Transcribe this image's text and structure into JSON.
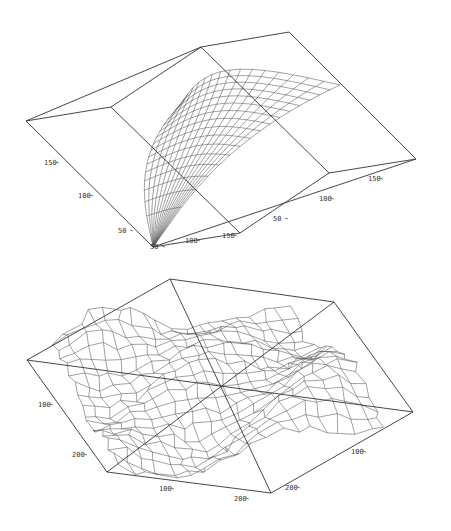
{
  "chart_data": [
    {
      "type": "surface-3d-wireframe",
      "title": "",
      "description": "Smooth saddle/dome wireframe surface inside a 3D bounding box",
      "surface_style": "smooth",
      "grid_lines": 16,
      "axes": [
        {
          "name": "left-axis",
          "ticks": [
            {
              "label": "50",
              "x": 128,
              "y": 231
            },
            {
              "label": "100",
              "x": 88,
              "y": 196
            },
            {
              "label": "150",
              "x": 54,
              "y": 163
            }
          ]
        },
        {
          "name": "front-axis",
          "ticks": [
            {
              "label": "50",
              "x": 160,
              "y": 247
            },
            {
              "label": "100",
              "x": 195,
              "y": 241
            },
            {
              "label": "150",
              "x": 232,
              "y": 236
            }
          ]
        },
        {
          "name": "right-axis",
          "ticks": [
            {
              "label": "50",
              "x": 283,
              "y": 219
            },
            {
              "label": "100",
              "x": 329,
              "y": 199
            },
            {
              "label": "150",
              "x": 378,
              "y": 179
            }
          ]
        }
      ],
      "box": {
        "lines": [
          [
            [
              26,
              121
            ],
            [
              111,
              107
            ],
            [
              201,
              47
            ],
            [
              289,
              32
            ]
          ],
          [
            [
              26,
              121
            ],
            [
              201,
              47
            ]
          ],
          [
            [
              289,
              32
            ],
            [
              416,
              159
            ]
          ],
          [
            [
              416,
              159
            ],
            [
              329,
              173
            ],
            [
              240,
              233
            ]
          ],
          [
            [
              26,
              121
            ],
            [
              153,
              247
            ]
          ],
          [
            [
              153,
              247
            ],
            [
              240,
              233
            ]
          ],
          [
            [
              153,
              247
            ],
            [
              416,
              159
            ]
          ],
          [
            [
              111,
              107
            ],
            [
              240,
              233
            ]
          ],
          [
            [
              201,
              47
            ],
            [
              329,
              173
            ]
          ]
        ]
      }
    },
    {
      "type": "surface-3d-wireframe",
      "title": "",
      "description": "Irregular rough terrain wireframe surface inside a 3D bounding box",
      "surface_style": "rough",
      "grid_lines": 18,
      "axes": [
        {
          "name": "left-axis",
          "ticks": [
            {
              "label": "100",
              "x": 48,
              "y": 405
            },
            {
              "label": "200",
              "x": 82,
              "y": 455
            }
          ]
        },
        {
          "name": "bottom-axis",
          "ticks": [
            {
              "label": "100",
              "x": 169,
              "y": 489
            },
            {
              "label": "200",
              "x": 244,
              "y": 499
            }
          ]
        },
        {
          "name": "right-axis",
          "ticks": [
            {
              "label": "100",
              "x": 361,
              "y": 452
            },
            {
              "label": "200",
              "x": 295,
              "y": 488
            }
          ]
        }
      ],
      "box": {
        "lines": [
          [
            [
              170,
              279
            ],
            [
              334,
              302
            ],
            [
              413,
              412
            ],
            [
              271,
              493
            ],
            [
              107,
              472
            ],
            [
              27,
              360
            ],
            [
              170,
              279
            ]
          ],
          [
            [
              27,
              360
            ],
            [
              413,
              412
            ]
          ],
          [
            [
              334,
              302
            ],
            [
              107,
              472
            ]
          ],
          [
            [
              170,
              279
            ],
            [
              271,
              493
            ]
          ]
        ]
      }
    }
  ]
}
